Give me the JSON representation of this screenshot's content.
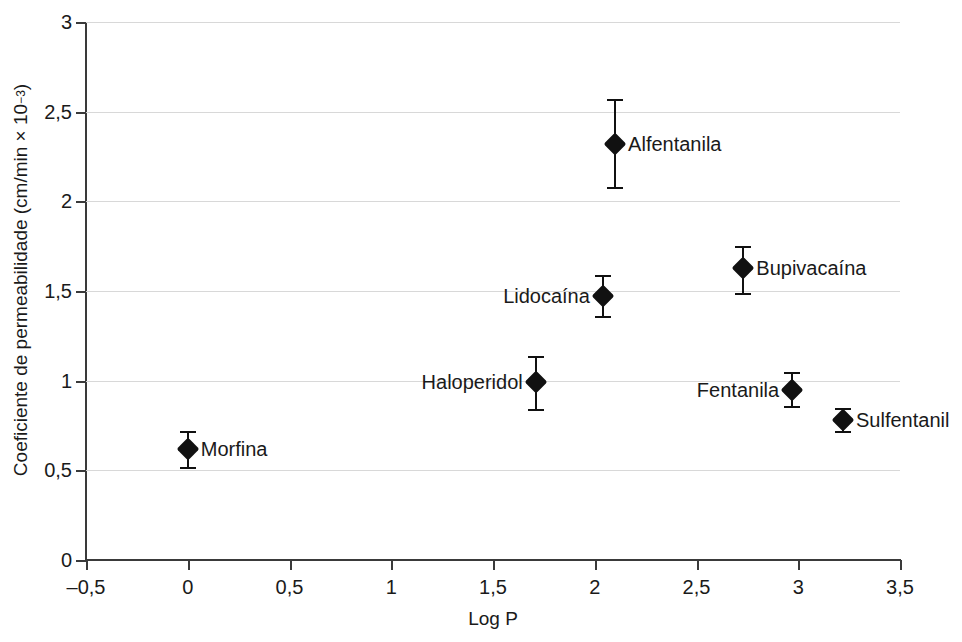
{
  "chart_data": {
    "type": "scatter",
    "title": "",
    "xlabel": "Log P",
    "ylabel": "Coeficiente de permeabilidade (cm/min × 10−3)",
    "ylabel_main": "Coeficiente de permeabilidade (cm/min × 10",
    "ylabel_exponent": "−3",
    "ylabel_close": ")",
    "xlim": [
      -0.5,
      3.5
    ],
    "ylim": [
      0,
      3
    ],
    "xticks": [
      -0.5,
      0,
      0.5,
      1,
      1.5,
      2,
      2.5,
      3,
      3.5
    ],
    "xticklabels": [
      "–0,5",
      "0",
      "0,5",
      "1",
      "1,5",
      "2",
      "2,5",
      "3",
      "3,5"
    ],
    "yticks": [
      0,
      0.5,
      1,
      1.5,
      2,
      2.5,
      3
    ],
    "yticklabels": [
      "0",
      "0,5",
      "1",
      "1,5",
      "2",
      "2,5",
      "3"
    ],
    "grid": "horizontal",
    "grid_color": "#d8d8d8",
    "marker": "diamond",
    "marker_color": "#111111",
    "legend": "none",
    "points": [
      {
        "label": "Morfina",
        "x": 0.0,
        "y": 0.62,
        "yerr_low": 0.52,
        "yerr_high": 0.72,
        "label_side": "right"
      },
      {
        "label": "Haloperidol",
        "x": 1.71,
        "y": 0.99,
        "yerr_low": 0.84,
        "yerr_high": 1.14,
        "label_side": "left"
      },
      {
        "label": "Lidocaína",
        "x": 2.04,
        "y": 1.47,
        "yerr_low": 1.36,
        "yerr_high": 1.59,
        "label_side": "left"
      },
      {
        "label": "Alfentanila",
        "x": 2.1,
        "y": 2.32,
        "yerr_low": 2.08,
        "yerr_high": 2.57,
        "label_side": "right"
      },
      {
        "label": "Bupivacaína",
        "x": 2.73,
        "y": 1.63,
        "yerr_low": 1.49,
        "yerr_high": 1.75,
        "label_side": "right"
      },
      {
        "label": "Fentanila",
        "x": 2.97,
        "y": 0.95,
        "yerr_low": 0.86,
        "yerr_high": 1.05,
        "label_side": "left"
      },
      {
        "label": "Sulfentanil",
        "x": 3.22,
        "y": 0.78,
        "yerr_low": 0.72,
        "yerr_high": 0.85,
        "label_side": "right"
      }
    ]
  }
}
